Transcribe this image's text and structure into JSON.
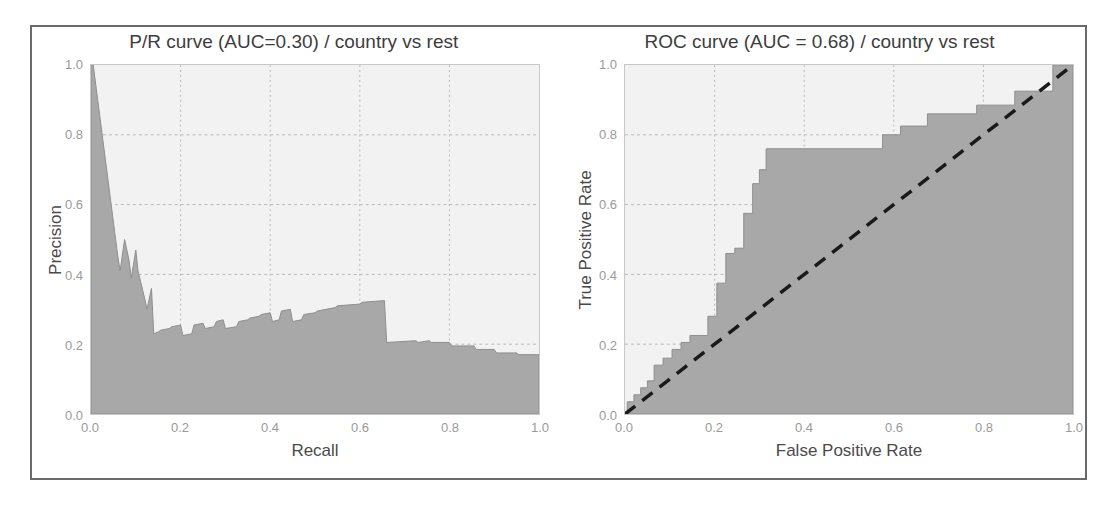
{
  "figure": {
    "background": "#ffffff",
    "border_color": "#6a6a6a",
    "fill_color": "#a8a8a8",
    "plot_background": "#f2f2f2",
    "grid_color": "#b9b9b9",
    "chance_line_color": "#1a1a1a"
  },
  "charts": [
    {
      "id": "pr-curve",
      "title": "P/R curve (AUC=0.30) / country vs rest",
      "xlabel": "Recall",
      "ylabel": "Precision",
      "xticks": [
        "0.0",
        "0.2",
        "0.4",
        "0.6",
        "0.8",
        "1.0"
      ],
      "yticks": [
        "0.0",
        "0.2",
        "0.4",
        "0.6",
        "0.8",
        "1.0"
      ],
      "auc": "0.30"
    },
    {
      "id": "roc-curve",
      "title": "ROC curve (AUC = 0.68) / country vs rest",
      "xlabel": "False Positive Rate",
      "ylabel": "True Positive Rate",
      "xticks": [
        "0.0",
        "0.2",
        "0.4",
        "0.6",
        "0.8",
        "1.0"
      ],
      "yticks": [
        "0.0",
        "0.2",
        "0.4",
        "0.6",
        "0.8",
        "1.0"
      ],
      "auc": "0.68"
    }
  ],
  "chart_data": [
    {
      "type": "area",
      "id": "pr-curve",
      "title": "P/R curve (AUC=0.30) / country vs rest",
      "xlabel": "Recall",
      "ylabel": "Precision",
      "xlim": [
        0.0,
        1.0
      ],
      "ylim": [
        0.0,
        1.0
      ],
      "grid": true,
      "legend": "none",
      "auc": 0.3,
      "series": [
        {
          "name": "Precision-Recall",
          "x": [
            0.0,
            0.005,
            0.06,
            0.065,
            0.075,
            0.085,
            0.09,
            0.1,
            0.105,
            0.12,
            0.125,
            0.135,
            0.14,
            0.15,
            0.155,
            0.175,
            0.18,
            0.2,
            0.205,
            0.225,
            0.23,
            0.25,
            0.255,
            0.275,
            0.28,
            0.295,
            0.3,
            0.325,
            0.33,
            0.35,
            0.355,
            0.375,
            0.38,
            0.4,
            0.405,
            0.42,
            0.425,
            0.445,
            0.45,
            0.47,
            0.475,
            0.5,
            0.505,
            0.545,
            0.55,
            0.6,
            0.605,
            0.655,
            0.66,
            0.725,
            0.73,
            0.755,
            0.76,
            0.8,
            0.805,
            0.855,
            0.86,
            0.9,
            0.905,
            0.95,
            0.955,
            1.0
          ],
          "y": [
            1.0,
            1.0,
            0.45,
            0.41,
            0.5,
            0.44,
            0.39,
            0.47,
            0.41,
            0.33,
            0.3,
            0.36,
            0.23,
            0.235,
            0.24,
            0.245,
            0.25,
            0.255,
            0.225,
            0.23,
            0.255,
            0.26,
            0.245,
            0.25,
            0.265,
            0.27,
            0.245,
            0.25,
            0.265,
            0.27,
            0.275,
            0.28,
            0.285,
            0.29,
            0.265,
            0.27,
            0.295,
            0.3,
            0.265,
            0.27,
            0.285,
            0.29,
            0.295,
            0.305,
            0.31,
            0.315,
            0.32,
            0.325,
            0.205,
            0.21,
            0.205,
            0.21,
            0.205,
            0.205,
            0.195,
            0.195,
            0.185,
            0.185,
            0.175,
            0.175,
            0.17,
            0.17
          ]
        }
      ]
    },
    {
      "type": "area",
      "id": "roc-curve",
      "title": "ROC curve (AUC = 0.68) / country vs rest",
      "xlabel": "False Positive Rate",
      "ylabel": "True Positive Rate",
      "xlim": [
        0.0,
        1.0
      ],
      "ylim": [
        0.0,
        1.0
      ],
      "grid": true,
      "legend": "none",
      "auc": 0.68,
      "series": [
        {
          "name": "ROC",
          "x": [
            0.0,
            0.005,
            0.005,
            0.02,
            0.02,
            0.035,
            0.035,
            0.05,
            0.05,
            0.065,
            0.065,
            0.085,
            0.085,
            0.105,
            0.105,
            0.125,
            0.125,
            0.145,
            0.145,
            0.185,
            0.185,
            0.205,
            0.205,
            0.225,
            0.225,
            0.245,
            0.245,
            0.265,
            0.265,
            0.285,
            0.285,
            0.3,
            0.3,
            0.315,
            0.315,
            0.575,
            0.575,
            0.615,
            0.615,
            0.675,
            0.675,
            0.785,
            0.785,
            0.87,
            0.87,
            0.955,
            0.955,
            1.0
          ],
          "y": [
            0.0,
            0.0,
            0.035,
            0.035,
            0.055,
            0.055,
            0.075,
            0.075,
            0.095,
            0.095,
            0.14,
            0.14,
            0.16,
            0.16,
            0.185,
            0.185,
            0.205,
            0.205,
            0.225,
            0.225,
            0.28,
            0.28,
            0.375,
            0.375,
            0.46,
            0.46,
            0.475,
            0.475,
            0.575,
            0.575,
            0.66,
            0.66,
            0.7,
            0.7,
            0.76,
            0.76,
            0.8,
            0.8,
            0.825,
            0.825,
            0.86,
            0.86,
            0.885,
            0.885,
            0.925,
            0.925,
            1.0,
            1.0
          ]
        },
        {
          "name": "Chance",
          "style": "dashed",
          "x": [
            0.0,
            1.0
          ],
          "y": [
            0.0,
            1.0
          ]
        }
      ]
    }
  ]
}
